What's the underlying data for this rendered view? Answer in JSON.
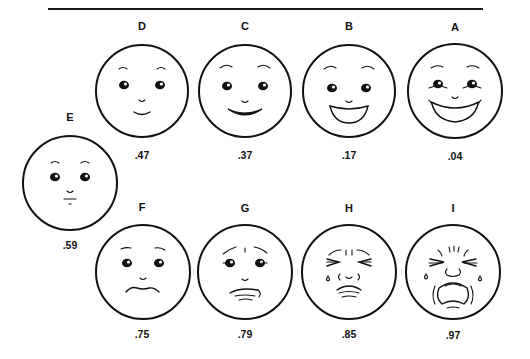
{
  "figure": {
    "faces": [
      {
        "id": "A",
        "value": ".04",
        "expression": "broad-grin",
        "row": "top"
      },
      {
        "id": "B",
        "value": ".17",
        "expression": "open-smile",
        "row": "top"
      },
      {
        "id": "C",
        "value": ".37",
        "expression": "smile",
        "row": "top"
      },
      {
        "id": "D",
        "value": ".47",
        "expression": "slight-smile",
        "row": "top"
      },
      {
        "id": "E",
        "value": ".59",
        "expression": "neutral",
        "row": "middle"
      },
      {
        "id": "F",
        "value": ".75",
        "expression": "slight-frown",
        "row": "bottom"
      },
      {
        "id": "G",
        "value": ".79",
        "expression": "worried-frown",
        "row": "bottom"
      },
      {
        "id": "H",
        "value": ".85",
        "expression": "grimace-tear",
        "row": "bottom"
      },
      {
        "id": "I",
        "value": ".97",
        "expression": "crying",
        "row": "bottom"
      }
    ],
    "colors": {
      "ink": "#111111",
      "background": "#ffffff"
    }
  }
}
